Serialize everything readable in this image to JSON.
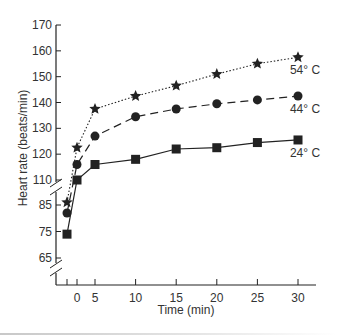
{
  "chart_data": {
    "type": "line",
    "title": "",
    "xlabel": "Time (min)",
    "ylabel": "Heart rate (beats/min)",
    "x_ticks": [
      {
        "value": "baseline",
        "label": ""
      },
      {
        "value": 0,
        "label": "0"
      },
      {
        "value": 5,
        "label": "5"
      },
      {
        "value": 10,
        "label": "10"
      },
      {
        "value": 15,
        "label": "15"
      },
      {
        "value": 20,
        "label": "20"
      },
      {
        "value": 25,
        "label": "25"
      },
      {
        "value": 30,
        "label": "30"
      }
    ],
    "y_ticks_upper": [
      110,
      120,
      130,
      140,
      150,
      160,
      170
    ],
    "y_ticks_lower": [
      65,
      75,
      85
    ],
    "ylim_upper": [
      110,
      170
    ],
    "ylim_lower": [
      60,
      85
    ],
    "axis_break": true,
    "grid": false,
    "legend": "inline labels at right end of each series",
    "x": [
      "baseline",
      0,
      5,
      10,
      15,
      20,
      25,
      30
    ],
    "series": [
      {
        "name": "54° C",
        "marker": "star",
        "line": "dotted",
        "values": [
          86,
          122.5,
          137.5,
          142.5,
          146.5,
          151,
          155,
          157.5
        ]
      },
      {
        "name": "44° C",
        "marker": "circle",
        "line": "dashed",
        "values": [
          82,
          116,
          127,
          134.5,
          137.5,
          139.5,
          141,
          142.5
        ]
      },
      {
        "name": "24° C",
        "marker": "square",
        "line": "solid",
        "values": [
          74,
          110,
          116,
          118,
          122,
          122.5,
          124.5,
          125.5
        ]
      }
    ],
    "colors": {
      "ink": "#222222",
      "text": "#333333"
    }
  }
}
